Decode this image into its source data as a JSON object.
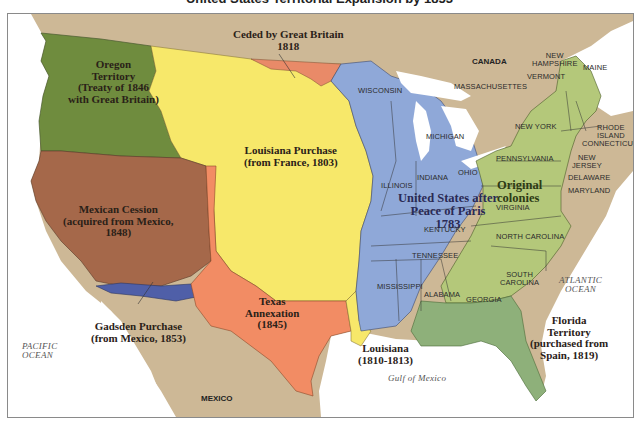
{
  "title": "United States Territorial Expansion by 1853",
  "colors": {
    "background_land": "#cdb896",
    "water": "#ffffff",
    "oregon": "#6f8c3e",
    "louisiana_purchase": "#f7e86a",
    "ceded_britain": "#e98a68",
    "mexican_cession": "#a5684a",
    "texas": "#f28c64",
    "gadsden": "#4f5fa8",
    "us_1783": "#8fa8d8",
    "original_colonies": "#b4c87a",
    "florida": "#8eb07a",
    "louisiana_1810": "#f7e86a"
  },
  "regions": [
    {
      "id": "oregon",
      "label_lines": [
        "Oregon",
        "Territory",
        "(Treaty of 1846",
        "with Great Britain)"
      ]
    },
    {
      "id": "ceded_britain",
      "label_lines": [
        "Ceded by Great Britain",
        "1818"
      ]
    },
    {
      "id": "louisiana_purchase",
      "label_lines": [
        "Louisiana Purchase",
        "(from France, 1803)"
      ]
    },
    {
      "id": "mexican_cession",
      "label_lines": [
        "Mexican Cession",
        "(acquired from Mexico,",
        "1848)"
      ]
    },
    {
      "id": "texas",
      "label_lines": [
        "Texas",
        "Annexation",
        "(1845)"
      ]
    },
    {
      "id": "gadsden",
      "label_lines": [
        "Gadsden Purchase",
        "(from Mexico, 1853)"
      ]
    },
    {
      "id": "us_1783",
      "label_lines": [
        "United States after",
        "Peace of Paris",
        "1783"
      ]
    },
    {
      "id": "original_colonies",
      "label_lines": [
        "Original",
        "colonies"
      ]
    },
    {
      "id": "louisiana_1810",
      "label_lines": [
        "Louisiana",
        "(1810-1813)"
      ]
    },
    {
      "id": "florida",
      "label_lines": [
        "Florida",
        "Territory",
        "(purchased from",
        "Spain, 1819)"
      ]
    }
  ],
  "states": {
    "wisconsin": "WISCONSIN",
    "michigan": "MICHIGAN",
    "illinois": "ILLINOIS",
    "indiana": "INDIANA",
    "ohio": "OHIO",
    "kentucky": "KENTUCKY",
    "tennessee": "TENNESSEE",
    "mississippi": "MISSISSIPPI",
    "alabama": "ALABAMA",
    "georgia": "GEORGIA",
    "south_carolina": [
      "SOUTH",
      "CAROLINA"
    ],
    "north_carolina": "NORTH CAROLINA",
    "virginia": "VIRGINIA",
    "maryland": "MARYLAND",
    "delaware": "DELAWARE",
    "new_jersey": [
      "NEW",
      "JERSEY"
    ],
    "pennsylvania": "PENNSYLVANIA",
    "new_york": "NEW YORK",
    "connecticut": "CONNECTICUT",
    "rhode_island": [
      "RHODE",
      "ISLAND"
    ],
    "massachusetts": "MASSACHUSETTES",
    "vermont": "VERMONT",
    "new_hampshire": [
      "NEW",
      "HAMPSHIRE"
    ],
    "maine": "MAINE"
  },
  "countries": {
    "canada": "CANADA",
    "mexico": "MEXICO"
  },
  "water_bodies": {
    "pacific": [
      "PACIFIC",
      "OCEAN"
    ],
    "atlantic": [
      "ATLANTIC",
      "OCEAN"
    ],
    "gulf": "Gulf of Mexico"
  }
}
